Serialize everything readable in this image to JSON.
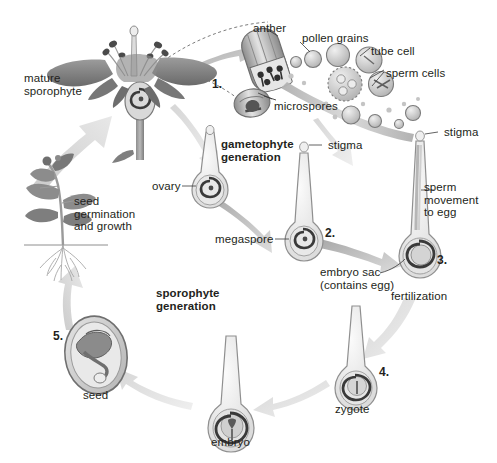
{
  "diagram": {
    "palette": {
      "background": "#ffffff",
      "text": "#231f20",
      "arrow_light": "#d9d9d9",
      "arrow_mid": "#bdbdbd",
      "arrow_dark": "#9a9a9a",
      "structure_fill": "#ededed",
      "structure_line": "#9b9b9b",
      "dark_accent": "#3f3f3f",
      "flower_dark": "#6e6e6e",
      "leaf_gray": "#8c8c8c"
    },
    "labels": [
      {
        "id": "mature-sporophyte",
        "text": "mature\nsporophyte",
        "x": 24,
        "y": 72,
        "align": "left",
        "bold": false
      },
      {
        "id": "anther",
        "text": "anther",
        "x": 253,
        "y": 22,
        "align": "left",
        "bold": false
      },
      {
        "id": "pollen-grains",
        "text": "pollen grains",
        "x": 302,
        "y": 32,
        "align": "left",
        "bold": false
      },
      {
        "id": "tube-cell",
        "text": "tube cell",
        "x": 371,
        "y": 45,
        "align": "left",
        "bold": false
      },
      {
        "id": "sperm-cells",
        "text": "sperm cells",
        "x": 386,
        "y": 67,
        "align": "left",
        "bold": false
      },
      {
        "id": "microspores",
        "text": "microspores",
        "x": 274,
        "y": 100,
        "align": "left",
        "bold": false
      },
      {
        "id": "step-1",
        "text": "1.",
        "x": 212,
        "y": 78,
        "align": "left",
        "bold": true
      },
      {
        "id": "gametophyte-generation",
        "text": "gametophyte\ngeneration",
        "x": 221,
        "y": 138,
        "align": "left",
        "bold": true
      },
      {
        "id": "stigma-left",
        "text": "stigma",
        "x": 311,
        "y": 140,
        "align": "left",
        "bold": false
      },
      {
        "id": "stigma-right",
        "text": "stigma",
        "x": 441,
        "y": 128,
        "align": "left",
        "bold": false
      },
      {
        "id": "ovary",
        "text": "ovary",
        "x": 160,
        "y": 180,
        "align": "left",
        "bold": false
      },
      {
        "id": "megaspore",
        "text": "megaspore",
        "x": 224,
        "y": 237,
        "align": "left",
        "bold": false
      },
      {
        "id": "sperm-movement",
        "text": "sperm\nmovement\nto egg",
        "x": 424,
        "y": 181,
        "align": "left",
        "bold": false
      },
      {
        "id": "step-2",
        "text": "2.",
        "x": 324,
        "y": 228,
        "align": "left",
        "bold": true
      },
      {
        "id": "step-3",
        "text": "3.",
        "x": 437,
        "y": 255,
        "align": "left",
        "bold": true
      },
      {
        "id": "embryo-sac",
        "text": "embryo sac\n(contains egg)",
        "x": 320,
        "y": 267,
        "align": "left",
        "bold": false
      },
      {
        "id": "fertilization",
        "text": "fertilization",
        "x": 394,
        "y": 289,
        "align": "left",
        "bold": false
      },
      {
        "id": "seed-germination",
        "text": "seed\ngermination\nand growth",
        "x": 74,
        "y": 196,
        "align": "left",
        "bold": false
      },
      {
        "id": "sporophyte-generation",
        "text": "sporophyte\ngeneration",
        "x": 157,
        "y": 288,
        "align": "left",
        "bold": true
      },
      {
        "id": "step-4",
        "text": "4.",
        "x": 379,
        "y": 367,
        "align": "left",
        "bold": true
      },
      {
        "id": "step-5",
        "text": "5.",
        "x": 54,
        "y": 331,
        "align": "left",
        "bold": true
      },
      {
        "id": "zygote",
        "text": "zygote",
        "x": 336,
        "y": 404,
        "align": "left",
        "bold": false
      },
      {
        "id": "seed",
        "text": "seed",
        "x": 83,
        "y": 390,
        "align": "left",
        "bold": false
      },
      {
        "id": "embryo",
        "text": "embryo",
        "x": 212,
        "y": 437,
        "align": "left",
        "bold": false
      }
    ],
    "stages": [
      {
        "key": "mature-sporophyte",
        "label": "mature sporophyte",
        "step": null
      },
      {
        "key": "anther-microspores",
        "label": "anther producing microspores",
        "step": "1."
      },
      {
        "key": "pollen-grains",
        "label": "pollen grains with tube cell and sperm cells",
        "step": null
      },
      {
        "key": "ovary-megaspore",
        "label": "ovary containing megaspore",
        "step": null
      },
      {
        "key": "embryo-sac",
        "label": "embryo sac (contains egg)",
        "step": "2."
      },
      {
        "key": "fertilization",
        "label": "fertilization / sperm movement to egg",
        "step": "3."
      },
      {
        "key": "zygote",
        "label": "zygote",
        "step": "4."
      },
      {
        "key": "embryo",
        "label": "embryo",
        "step": null
      },
      {
        "key": "seed",
        "label": "seed",
        "step": "5."
      },
      {
        "key": "germination",
        "label": "seed germination and growth",
        "step": null
      }
    ],
    "generations": [
      {
        "name": "gametophyte generation",
        "position": "upper-center"
      },
      {
        "name": "sporophyte generation",
        "position": "lower-center"
      }
    ]
  }
}
